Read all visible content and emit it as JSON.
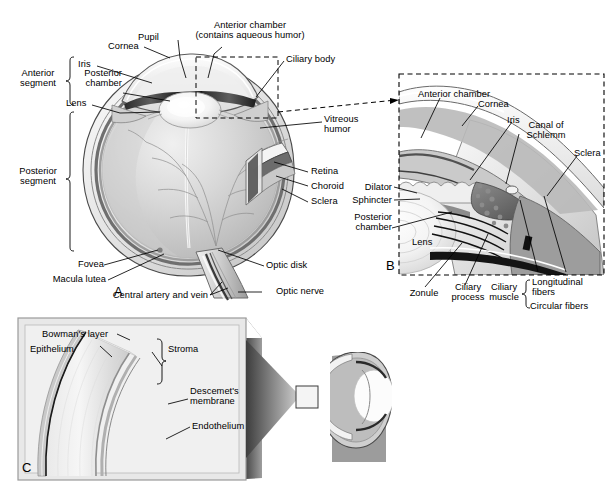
{
  "figure": {
    "background_color": "#ffffff",
    "line_color": "#000000"
  },
  "panels": [
    {
      "id": "A",
      "name": "sagittal-section-whole-eye",
      "letter": "A",
      "brackets": [
        {
          "name": "anterior-segment",
          "label_line1": "Anterior",
          "label_line2": "segment"
        },
        {
          "name": "posterior-segment",
          "label_line1": "Posterior",
          "label_line2": "segment"
        }
      ],
      "labels": [
        {
          "name": "anterior-chamber",
          "line1": "Anterior chamber",
          "line2": "(contains aqueous humor)"
        },
        {
          "name": "pupil",
          "line1": "Pupil"
        },
        {
          "name": "cornea",
          "line1": "Cornea"
        },
        {
          "name": "iris",
          "line1": "Iris"
        },
        {
          "name": "posterior-chamber",
          "line1": "Posterior",
          "line2": "chamber"
        },
        {
          "name": "lens",
          "line1": "Lens"
        },
        {
          "name": "ciliary-body",
          "line1": "Ciliary body"
        },
        {
          "name": "vitreous-humor",
          "line1": "Vitreous",
          "line2": "humor"
        },
        {
          "name": "retina",
          "line1": "Retina"
        },
        {
          "name": "choroid",
          "line1": "Choroid"
        },
        {
          "name": "sclera",
          "line1": "Sclera"
        },
        {
          "name": "fovea",
          "line1": "Fovea"
        },
        {
          "name": "macula-lutea",
          "line1": "Macula lutea"
        },
        {
          "name": "central-artery-and-vein",
          "line1": "Central artery and vein"
        },
        {
          "name": "optic-disk",
          "line1": "Optic disk"
        },
        {
          "name": "optic-nerve",
          "line1": "Optic nerve"
        }
      ]
    },
    {
      "id": "B",
      "name": "anterior-segment-detail",
      "letter": "B",
      "labels": [
        {
          "name": "anterior-chamber",
          "line1": "Anterior chamber"
        },
        {
          "name": "cornea",
          "line1": "Cornea"
        },
        {
          "name": "iris",
          "line1": "Iris"
        },
        {
          "name": "canal-of-schlemm",
          "line1": "Canal of",
          "line2": "Schlemm"
        },
        {
          "name": "sclera",
          "line1": "Sclera"
        },
        {
          "name": "dilator",
          "line1": "Dilator"
        },
        {
          "name": "sphincter",
          "line1": "Sphincter"
        },
        {
          "name": "posterior-chamber",
          "line1": "Posterior",
          "line2": "chamber"
        },
        {
          "name": "lens",
          "line1": "Lens"
        },
        {
          "name": "zonule",
          "line1": "Zonule"
        },
        {
          "name": "ciliary-process",
          "line1": "Ciliary",
          "line2": "process"
        },
        {
          "name": "ciliary-muscle",
          "line1": "Ciliary",
          "line2": "muscle"
        },
        {
          "name": "longitudinal-fibers",
          "line1": "Longitudinal",
          "line2": "fibers"
        },
        {
          "name": "circular-fibers",
          "line1": "Circular fibers"
        }
      ]
    },
    {
      "id": "C",
      "name": "cornea-layers-detail",
      "letter": "C",
      "labels": [
        {
          "name": "bowmans-layer",
          "line1": "Bowman's layer"
        },
        {
          "name": "epithelium",
          "line1": "Epithelium"
        },
        {
          "name": "stroma",
          "line1": "Stroma"
        },
        {
          "name": "descemets-membrane",
          "line1": "Descemet's",
          "line2": "membrane"
        },
        {
          "name": "endothelium",
          "line1": "Endothelium"
        }
      ]
    }
  ]
}
